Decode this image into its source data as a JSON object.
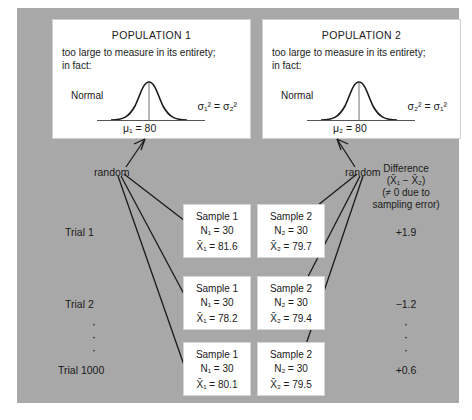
{
  "figure": {
    "background": "#a8a8a8",
    "box_fill": "#ffffff"
  },
  "populations": [
    {
      "title": "POPULATION 1",
      "desc_line1": "too large to measure in its entirety;",
      "desc_line2": "in fact:",
      "curve_label": "Normal",
      "variance_left": "σ",
      "variance_text": "σ₁² = σ₂²",
      "mean_text": "μ₁ = 80",
      "mean_value": 80
    },
    {
      "title": "POPULATION 2",
      "desc_line1": "too large to measure in its entirety;",
      "desc_line2": "in fact:",
      "curve_label": "Normal",
      "variance_text": "σ₂² = σ₁²",
      "mean_text": "μ₂ = 80",
      "mean_value": 80
    }
  ],
  "sampling": {
    "random_label_left": "random",
    "random_label_right": "random"
  },
  "difference_column": {
    "head_line1": "Difference",
    "head_line2": "(X̄₁ − X̄₂)",
    "head_line3": "(≠ 0 due to",
    "head_line4": "sampling error)"
  },
  "trials": [
    {
      "label": "Trial 1",
      "sample1": {
        "name": "Sample 1",
        "n_label": "N₁ = 30",
        "n": 30,
        "mean_label": "X̄₁ = 81.6",
        "mean": 81.6
      },
      "sample2": {
        "name": "Sample 2",
        "n_label": "N₂ = 30",
        "n": 30,
        "mean_label": "X̄₂ = 79.7",
        "mean": 79.7
      },
      "difference": "+1.9"
    },
    {
      "label": "Trial 2",
      "sample1": {
        "name": "Sample 1",
        "n_label": "N₁ = 30",
        "n": 30,
        "mean_label": "X̄₁ = 78.2",
        "mean": 78.2
      },
      "sample2": {
        "name": "Sample 2",
        "n_label": "N₂ = 30",
        "n": 30,
        "mean_label": "X̄₂ = 79.4",
        "mean": 79.4
      },
      "difference": "−1.2"
    },
    {
      "label": "Trial 1000",
      "sample1": {
        "name": "Sample 1",
        "n_label": "N₁ = 30",
        "n": 30,
        "mean_label": "X̄₁ = 80.1",
        "mean": 80.1
      },
      "sample2": {
        "name": "Sample 2",
        "n_label": "N₂ = 30",
        "n": 30,
        "mean_label": "X̄₂ = 79.5",
        "mean": 79.5
      },
      "difference": "+0.6"
    }
  ],
  "ellipsis": {
    "dot": "·",
    "count": 3
  }
}
